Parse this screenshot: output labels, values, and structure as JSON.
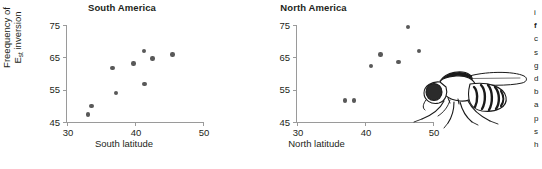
{
  "figure": {
    "background_color": "#ffffff",
    "marker_color": "#595959",
    "axis_color": "#9a9a9a",
    "text_color": "#231f20"
  },
  "yaxis": {
    "label_line1": "Freequency of",
    "label_line2_prefix": "E",
    "label_line2_sub": "st",
    "label_line2_suffix": " inversion",
    "ticks": [
      45,
      55,
      65,
      75
    ],
    "min": 45,
    "max": 75
  },
  "panels": [
    {
      "id": "south",
      "title": "South America",
      "xlabel": "South latitude",
      "xticks": [
        30,
        40,
        50
      ],
      "xmin": 30,
      "xmax": 50
    },
    {
      "id": "north",
      "title": "North America",
      "xlabel": "North latitude",
      "xticks": [
        30,
        40,
        50
      ],
      "xmin": 30,
      "xmax": 50
    }
  ],
  "illustration": {
    "name": "drosophila-fly-drawing",
    "description": "Line drawing of a fruit fly in side view"
  },
  "caption_column": {
    "lines": [
      "i",
      "f",
      "c",
      "s",
      "g",
      "d",
      "b",
      "a",
      "p",
      "s",
      "h"
    ]
  },
  "chart_data": [
    {
      "type": "scatter",
      "title": "South America",
      "xlabel": "South latitude",
      "ylabel": "Freequency of Est inversion",
      "xlim": [
        30,
        50
      ],
      "ylim": [
        45,
        75
      ],
      "xticks": [
        30,
        40,
        50
      ],
      "yticks": [
        45,
        55,
        65,
        75
      ],
      "grid": false,
      "legend": "none",
      "points": [
        {
          "x": 33.1,
          "y": 47.3
        },
        {
          "x": 33.6,
          "y": 50.0
        },
        {
          "x": 36.7,
          "y": 61.7
        },
        {
          "x": 37.2,
          "y": 54.0
        },
        {
          "x": 39.8,
          "y": 63.1
        },
        {
          "x": 41.3,
          "y": 67.0
        },
        {
          "x": 41.4,
          "y": 56.8
        },
        {
          "x": 42.6,
          "y": 64.6
        },
        {
          "x": 45.5,
          "y": 65.9
        }
      ]
    },
    {
      "type": "scatter",
      "title": "North America",
      "xlabel": "North latitude",
      "ylabel": "Freequency of Est inversion",
      "xlim": [
        30,
        50
      ],
      "ylim": [
        45,
        75
      ],
      "xticks": [
        30,
        40,
        50
      ],
      "yticks": [
        45,
        55,
        65,
        75
      ],
      "grid": false,
      "legend": "none",
      "points": [
        {
          "x": 37.1,
          "y": 51.6
        },
        {
          "x": 38.4,
          "y": 51.7
        },
        {
          "x": 40.9,
          "y": 62.3
        },
        {
          "x": 42.3,
          "y": 65.9
        },
        {
          "x": 44.9,
          "y": 63.6
        },
        {
          "x": 46.3,
          "y": 74.3
        },
        {
          "x": 47.9,
          "y": 66.9
        }
      ]
    }
  ]
}
